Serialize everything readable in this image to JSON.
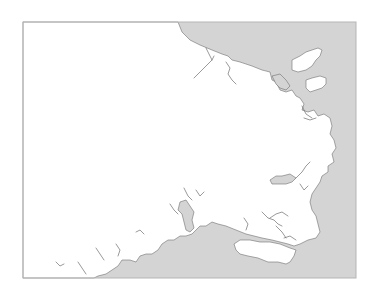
{
  "map": {
    "width": 381,
    "height": 296,
    "frame": {
      "x": 23,
      "y": 22,
      "width": 333,
      "height": 256
    },
    "colors": {
      "sea": "#d4d4d4",
      "land": "#ffffff",
      "coast": "#6e6e6e",
      "frame": "#b5b5b5"
    },
    "mainland": "23,22 178,22 182,32 190,40 200,45 212,50 222,54 228,56 232,60 240,62 246,64 252,66 262,70 270,72 272,80 276,82 280,90 286,92 292,90 296,96 300,98 304,104 302,110 308,112 314,110 318,116 324,114 330,118 332,126 330,134 334,140 336,148 332,154 334,162 328,166 328,172 322,176 320,182 316,188 312,194 310,202 312,210 316,216 318,224 320,232 316,238 308,240 300,244 294,246 288,244 280,242 272,240 262,238 254,236 246,234 236,230 226,226 218,224 212,222 206,226 200,226 196,230 192,234 186,236 180,236 174,240 168,240 162,244 158,250 152,254 146,254 140,256 136,262 130,260 122,260 118,266 112,270 106,274 98,276 94,278 23,278",
    "islands": [
      "292,60 300,56 306,52 312,50 318,48 322,50 320,56 316,60 312,66 306,70 298,72 292,70",
      "306,80 312,78 320,76 326,78 326,84 322,88 316,90 310,92 306,88",
      "234,244 240,240 250,240 260,242 270,242 280,244 290,248 296,250 294,256 290,262 286,264 278,262 268,262 258,258 248,256 240,254 236,250"
    ],
    "sea_patches": [
      "272,76 280,74 286,80 290,86 286,90 280,88 276,84",
      "270,180 276,176 282,176 290,174 296,178 292,182 286,184 278,184 272,184",
      "180,202 186,200 190,206 194,212 192,220 194,228 190,232 186,230 184,222 182,214 178,210"
    ],
    "inlets": [
      "M194,78 L200,72 L206,66 L212,60 L214,56",
      "M206,48 L210,56 L212,60",
      "M226,62 L230,68 L228,74 L232,80 L236,84",
      "M302,106 L306,114 L312,118",
      "M304,118 L310,120 L316,118",
      "M296,178 L302,172 L306,166 L310,162",
      "M300,184 L304,190 L308,186",
      "M262,212 L268,218 L274,220 L278,224 L282,226",
      "M270,218 L276,214 L282,212 L288,216",
      "M276,226 L282,232 L286,238",
      "M244,218 L248,224 L246,230",
      "M184,188 L188,196 L192,200",
      "M196,190 L200,196 L204,192",
      "M170,204 L174,210 L178,214",
      "M136,232 L140,230 L144,234",
      "M116,244 L120,250 L118,256",
      "M96,248 L100,254 L104,260",
      "M78,262 L82,268 L86,274",
      "M56,262 L60,266 L64,264",
      "M284,238 L290,236 L296,240"
    ]
  }
}
